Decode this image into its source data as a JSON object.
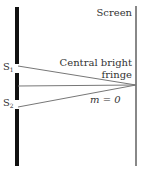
{
  "diagram": {
    "labels": {
      "screen": "Screen",
      "slit1": "S",
      "slit1_sub": "1",
      "slit2": "S",
      "slit2_sub": "2",
      "fringe_line1": "Central bright",
      "fringe_line2": "fringe",
      "order": "m = 0"
    },
    "colors": {
      "barrier": "#111111",
      "screen": "#888888",
      "rays": "#777777",
      "text": "#333333"
    }
  }
}
